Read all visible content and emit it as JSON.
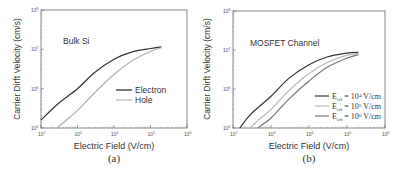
{
  "chart_data": [
    {
      "id": "a",
      "type": "line",
      "caption": "(a)",
      "annotation": "Bulk Si",
      "xlabel": "Electric Field (V/cm)",
      "ylabel": "Carrier Dirft Velocity (cm/s)",
      "xscale": "log",
      "yscale": "log",
      "xlim": [
        100,
        1000000
      ],
      "ylim": [
        100000,
        100000000
      ],
      "xticks": [
        "10^2",
        "10^3",
        "10^4",
        "10^5",
        "10^6"
      ],
      "yticks": [
        "10^5",
        "10^6",
        "10^7",
        "10^8"
      ],
      "grid": false,
      "legend_position": "center-right",
      "series": [
        {
          "name": "Electron",
          "color": "#333333",
          "x": [
            100,
            300,
            1000,
            3000,
            10000,
            30000,
            100000,
            200000
          ],
          "y": [
            160000,
            420000,
            1000000,
            2600000,
            5600000,
            8500000,
            10500000,
            11500000
          ]
        },
        {
          "name": "Hole",
          "color": "#b0b0b0",
          "x": [
            270,
            500,
            1000,
            3000,
            10000,
            30000,
            100000,
            200000
          ],
          "y": [
            100000,
            160000,
            280000,
            800000,
            2300000,
            5000000,
            8800000,
            11000000
          ]
        }
      ]
    },
    {
      "id": "b",
      "type": "line",
      "caption": "(b)",
      "annotation": "MOSFET Channel",
      "xlabel": "Electric Field (V/cm)",
      "ylabel": "Carrier Dirft Velocity (cm/s)",
      "xscale": "log",
      "yscale": "log",
      "xlim": [
        100,
        1000000
      ],
      "ylim": [
        100000,
        100000000
      ],
      "xticks": [
        "10^2",
        "10^3",
        "10^4",
        "10^5",
        "10^6"
      ],
      "yticks": [
        "10^5",
        "10^6",
        "10^7",
        "10^8"
      ],
      "grid": false,
      "legend_position": "lower-right",
      "series": [
        {
          "name": "E_eff = 10^4 V/cm",
          "legend": {
            "base": "E",
            "sub": "eff",
            "text": " = 10",
            "exp": "4",
            "unit": " V/cm"
          },
          "color": "#333333",
          "x": [
            150,
            300,
            1000,
            3000,
            10000,
            30000,
            100000,
            200000
          ],
          "y": [
            100000,
            230000,
            650000,
            1900000,
            4200000,
            6600000,
            8300000,
            8800000
          ]
        },
        {
          "name": "E_eff = 10^5 V/cm",
          "legend": {
            "base": "E",
            "sub": "eff",
            "text": " = 10",
            "exp": "5",
            "unit": " V/cm"
          },
          "color": "#b8b8b8",
          "x": [
            280,
            500,
            1000,
            3000,
            10000,
            30000,
            100000,
            200000
          ],
          "y": [
            100000,
            170000,
            300000,
            920000,
            2500000,
            4800000,
            7300000,
            8200000
          ]
        },
        {
          "name": "E_eff = 10^6 V/cm",
          "legend": {
            "base": "E",
            "sub": "eff",
            "text": " = 10",
            "exp": "6",
            "unit": " V/cm"
          },
          "color": "#777777",
          "x": [
            450,
            1000,
            3000,
            10000,
            30000,
            100000,
            200000
          ],
          "y": [
            100000,
            180000,
            560000,
            1600000,
            3600000,
            6200000,
            7600000
          ]
        }
      ]
    }
  ],
  "charts": {
    "a": {
      "caption": "(a)",
      "annotation": "Bulk Si",
      "xlabel": "Electric Field (V/cm)",
      "ylabel": "Carrier Dirft Velocity (cm/s)",
      "legend": [
        "Electron",
        "Hole"
      ]
    },
    "b": {
      "caption": "(b)",
      "annotation": "MOSFET Channel",
      "xlabel": "Electric Field (V/cm)",
      "ylabel": "Carrier Dirft Velocity (cm/s)"
    }
  }
}
